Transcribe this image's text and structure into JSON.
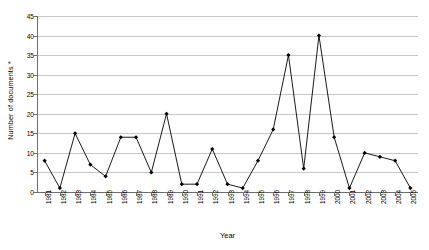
{
  "chart_data": {
    "type": "line",
    "title": "",
    "xlabel": "Year",
    "ylabel": "Number of documents *",
    "ylim": [
      0,
      45
    ],
    "ytick_step": 5,
    "yticks": [
      0,
      5,
      10,
      15,
      20,
      25,
      30,
      35,
      40,
      45
    ],
    "grid": true,
    "legend": false,
    "marker": "diamond",
    "line_color": "#000000",
    "marker_color": "#000000",
    "grid_color": "#c8c8c8",
    "categories": [
      "1981",
      "1982",
      "1983",
      "1984",
      "1985",
      "1986",
      "1987",
      "1988",
      "1989",
      "1990",
      "1991",
      "1992",
      "1993",
      "1994",
      "1995",
      "1996",
      "1997",
      "1998",
      "1999",
      "2000",
      "2001",
      "2002",
      "2003",
      "2004",
      "2005"
    ],
    "values": [
      8,
      1,
      15,
      7,
      4,
      14,
      14,
      5,
      20,
      2,
      2,
      11,
      2,
      1,
      8,
      16,
      35,
      6,
      40,
      14,
      1,
      10,
      9,
      8,
      1
    ]
  }
}
